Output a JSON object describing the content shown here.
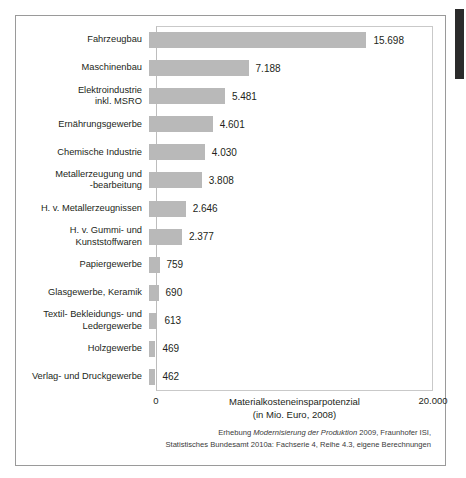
{
  "chart_data": {
    "type": "bar",
    "orientation": "horizontal",
    "title": "",
    "xlabel": "Materialkosteneinsparpotenzial (in Mio. Euro, 2008)",
    "xlabel_line1": "Materialkosteneinsparpotenzial",
    "xlabel_line2": "(in Mio. Euro, 2008)",
    "ylabel": "",
    "xlim": [
      0,
      20000
    ],
    "xticks": [
      0,
      20000
    ],
    "xtick_labels": [
      "0",
      "20.000"
    ],
    "grid": false,
    "legend": null,
    "bar_color": "#b9b9b9",
    "categories": [
      "Fahrzeugbau",
      "Maschinenbau",
      "Elektroindustrie\ninkl. MSRO",
      "Ernährungsgewerbe",
      "Chemische Industrie",
      "Metallerzeugung und\n-bearbeitung",
      "H. v. Metallerzeugnissen",
      "H. v. Gummi- und\nKunststoffwaren",
      "Papiergewerbe",
      "Glasgewerbe, Keramik",
      "Textil- Bekleidungs- und\nLedergewerbe",
      "Holzgewerbe",
      "Verlag- und Druckgewerbe"
    ],
    "values": [
      15698,
      7188,
      5481,
      4601,
      4030,
      3808,
      2646,
      2377,
      759,
      690,
      613,
      469,
      462
    ],
    "value_labels": [
      "15.698",
      "7.188",
      "5.481",
      "4.601",
      "4.030",
      "3.808",
      "2.646",
      "2.377",
      "759",
      "690",
      "613",
      "469",
      "462"
    ]
  },
  "source_note": {
    "line1_pre": "Erhebung ",
    "line1_italic": "Modernisierung der Produktion",
    "line1_post": " 2009, Fraunhofer ISI,",
    "line2": "Statistisches Bundesamt 2010a: Fachserie 4, Reihe 4.3, eigene Berechnungen"
  }
}
